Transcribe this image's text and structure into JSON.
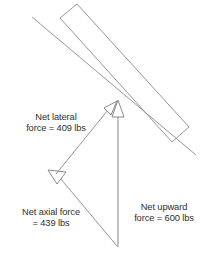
{
  "diagram": {
    "background_color": "#ffffff",
    "stroke_color": "#808080",
    "text_color": "#2e2e2e",
    "labels": {
      "lateral": {
        "line1": "Net lateral",
        "line2": "force = 409 lbs",
        "value": 409,
        "unit": "lbs",
        "name": "Net lateral force"
      },
      "axial": {
        "line1": "Net axial force",
        "line2": "= 439 lbs",
        "value": 439,
        "unit": "lbs",
        "name": "Net axial force"
      },
      "upward": {
        "line1": "Net upward",
        "line2": "force = 600 lbs",
        "value": 600,
        "unit": "lbs",
        "name": "Net upward force"
      }
    },
    "shapes": {
      "beam": "inclined rectangular beam",
      "beam_axis": "center axis line through beam",
      "lateral_vector": "arrow pointing up-right to beam axis",
      "axial_vector": "arrow pointing down-left parallel to beam",
      "upward_vector": "vertical arrow pointing up"
    }
  }
}
